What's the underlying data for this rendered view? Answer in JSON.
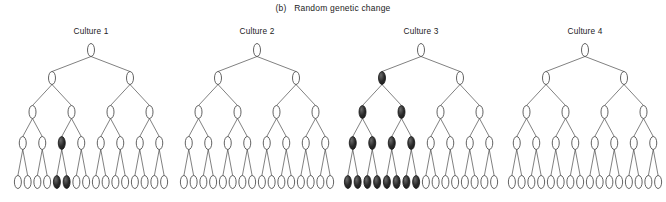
{
  "figure": {
    "caption_prefix": "(b)",
    "caption": "(b)   Random genetic change",
    "panel_letter": "(b)",
    "panel_title": "Random genetic change",
    "colors": {
      "background": "#ffffff",
      "node_outline": "#3b3b3b",
      "node_open_fill": "#ffffff",
      "node_filled_fill": "#1b1b1b",
      "edge": "#4a4a4a",
      "text": "#1c1c1c"
    },
    "tree_structure": {
      "levels": 5,
      "nodes_per_level": [
        1,
        2,
        4,
        8,
        16
      ],
      "node_shape": "ellipse",
      "node_width_px": 7,
      "node_height_px": 13
    },
    "legend_note": "filled ovals = mutant lineage, open ovals = wild type"
  },
  "cultures": [
    {
      "label": "Culture 1",
      "filled_nodes": [
        {
          "level": 4,
          "index": 2
        },
        {
          "level": 5,
          "index": 4
        },
        {
          "level": 5,
          "index": 5
        }
      ],
      "filled_count": 3
    },
    {
      "label": "Culture 2",
      "filled_nodes": [],
      "filled_count": 0
    },
    {
      "label": "Culture 3",
      "filled_nodes": [
        {
          "level": 2,
          "index": 0
        },
        {
          "level": 3,
          "index": 0
        },
        {
          "level": 3,
          "index": 1
        },
        {
          "level": 4,
          "index": 0
        },
        {
          "level": 4,
          "index": 1
        },
        {
          "level": 4,
          "index": 2
        },
        {
          "level": 4,
          "index": 3
        },
        {
          "level": 5,
          "index": 0
        },
        {
          "level": 5,
          "index": 1
        },
        {
          "level": 5,
          "index": 2
        },
        {
          "level": 5,
          "index": 3
        },
        {
          "level": 5,
          "index": 4
        },
        {
          "level": 5,
          "index": 5
        },
        {
          "level": 5,
          "index": 6
        },
        {
          "level": 5,
          "index": 7
        }
      ],
      "filled_count": 15
    },
    {
      "label": "Culture 4",
      "filled_nodes": [],
      "filled_count": 0
    }
  ]
}
